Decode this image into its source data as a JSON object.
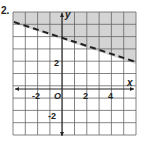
{
  "problem_label": "2.",
  "chart_data": {
    "type": "line",
    "title": "",
    "xlabel": "x",
    "ylabel": "y",
    "xlim": [
      -4,
      6
    ],
    "ylim": [
      -4,
      6
    ],
    "grid": true,
    "x_tick_labels": [
      "-2",
      "O",
      "2",
      "4"
    ],
    "y_tick_labels": [
      "2",
      "-2"
    ],
    "series": [
      {
        "name": "boundary",
        "style": "dashed",
        "equation": "y = -x/3 + 4",
        "x": [
          -4,
          6
        ],
        "y": [
          5.33,
          2
        ]
      }
    ],
    "shaded_region": "above boundary line",
    "inequality": "y > -1/3 x + 4"
  },
  "colors": {
    "shade": "#d4d4d4",
    "grid": "#555555",
    "line": "#222222"
  }
}
